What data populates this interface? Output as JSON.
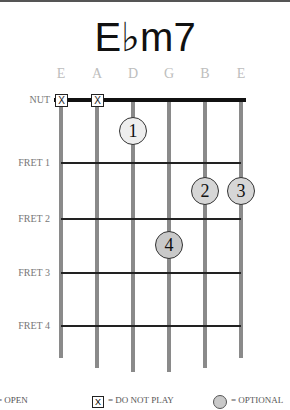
{
  "chord": {
    "name": "E♭m7"
  },
  "colors": {
    "finger_fill": "#eeeeee",
    "finger_fill_dark": "#cfcfcf",
    "string": "#8a8a8a",
    "string_label": "#bdbdbd"
  },
  "strings": [
    "E",
    "A",
    "D",
    "G",
    "B",
    "E"
  ],
  "nut_label": "NUT",
  "frets": [
    {
      "label": "FRET 1"
    },
    {
      "label": "FRET 2"
    },
    {
      "label": "FRET 3"
    },
    {
      "label": "FRET 4"
    }
  ],
  "muted_strings": [
    {
      "string": "E",
      "symbol": "X"
    },
    {
      "string": "A",
      "symbol": "X"
    }
  ],
  "fingers": [
    {
      "finger": "1",
      "string": "D",
      "position": "between nut and fret 1"
    },
    {
      "finger": "2",
      "string": "B",
      "position": "between fret 1 and fret 2"
    },
    {
      "finger": "3",
      "string": "E",
      "position": "between fret 1 and fret 2"
    },
    {
      "finger": "4",
      "string": "G",
      "position": "between fret 2 and fret 3"
    }
  ],
  "legend": {
    "open": "= OPEN",
    "do_not_play_symbol": "X",
    "do_not_play": "= DO NOT PLAY",
    "optional": "= OPTIONAL"
  }
}
